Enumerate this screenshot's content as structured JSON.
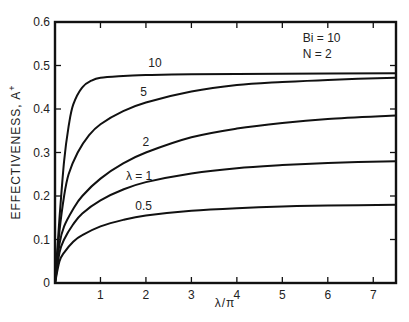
{
  "chart_data": {
    "type": "line",
    "title": "",
    "xlabel": "λ/π",
    "ylabel": "EFFECTIVENESS, A",
    "ylabel_superscript": "+",
    "xlim": [
      0,
      7.5
    ],
    "ylim": [
      0,
      0.6
    ],
    "xticks": [
      0,
      1,
      2,
      3,
      4,
      5,
      6,
      7
    ],
    "xtick_labels": [
      "",
      "1",
      "2",
      "3",
      "4",
      "5",
      "6",
      "7"
    ],
    "yticks": [
      0,
      0.1,
      0.2,
      0.3,
      0.4,
      0.5,
      0.6
    ],
    "ytick_labels": [
      "0",
      "0.1",
      "0.2",
      "0.3",
      "0.4",
      "0.5",
      "0.6"
    ],
    "grid": false,
    "legend": "inline curve labels",
    "annotations": [
      {
        "text": "Bi = 10",
        "x": 5.45,
        "y": 0.555
      },
      {
        "text": "N = 2",
        "x": 5.45,
        "y": 0.517
      }
    ],
    "series": [
      {
        "name": "10",
        "label": "10",
        "label_pos": [
          2.2,
          0.497
        ],
        "x": [
          0,
          0.1,
          0.2,
          0.3,
          0.4,
          0.6,
          0.8,
          1.0,
          1.5,
          2,
          3,
          5,
          7.5
        ],
        "y": [
          0,
          0.15,
          0.28,
          0.36,
          0.41,
          0.45,
          0.465,
          0.472,
          0.476,
          0.478,
          0.48,
          0.481,
          0.482
        ]
      },
      {
        "name": "5",
        "label": "5",
        "label_pos": [
          1.95,
          0.43
        ],
        "x": [
          0,
          0.1,
          0.2,
          0.3,
          0.5,
          0.75,
          1,
          1.5,
          2,
          3,
          4,
          5,
          6,
          7.5
        ],
        "y": [
          0,
          0.12,
          0.2,
          0.25,
          0.3,
          0.34,
          0.365,
          0.395,
          0.415,
          0.44,
          0.455,
          0.462,
          0.467,
          0.472
        ]
      },
      {
        "name": "2",
        "label": "2",
        "label_pos": [
          2.0,
          0.315
        ],
        "x": [
          0,
          0.1,
          0.2,
          0.4,
          0.6,
          1,
          1.5,
          2,
          3,
          4,
          5,
          6,
          7.5
        ],
        "y": [
          0,
          0.09,
          0.13,
          0.17,
          0.2,
          0.24,
          0.275,
          0.3,
          0.335,
          0.355,
          0.368,
          0.377,
          0.385
        ]
      },
      {
        "name": "λ = 1",
        "label": "λ = 1",
        "label_pos": [
          1.85,
          0.237
        ],
        "x": [
          0,
          0.1,
          0.2,
          0.4,
          0.6,
          1,
          1.5,
          2,
          3,
          4,
          5,
          6,
          7.5
        ],
        "y": [
          0,
          0.07,
          0.1,
          0.135,
          0.16,
          0.19,
          0.215,
          0.232,
          0.252,
          0.264,
          0.271,
          0.276,
          0.28
        ]
      },
      {
        "name": "0.5",
        "label": "0.5",
        "label_pos": [
          1.95,
          0.168
        ],
        "x": [
          0,
          0.1,
          0.2,
          0.4,
          0.6,
          1,
          1.5,
          2,
          3,
          4,
          5,
          6,
          7.5
        ],
        "y": [
          0,
          0.05,
          0.07,
          0.095,
          0.11,
          0.13,
          0.145,
          0.155,
          0.166,
          0.172,
          0.176,
          0.178,
          0.18
        ]
      }
    ]
  },
  "colors": {
    "line": "#111111",
    "background": "#ffffff"
  }
}
